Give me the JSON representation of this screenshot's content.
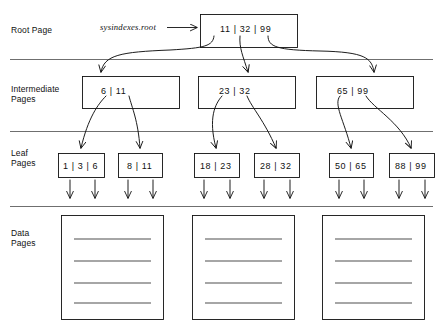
{
  "diagram": {
    "pointer_label": "sysindexes.root",
    "levels": [
      {
        "name": "root",
        "label": "Root Page"
      },
      {
        "name": "intermediate",
        "label": "Intermediate\nPages"
      },
      {
        "name": "leaf",
        "label": "Leaf\nPages"
      },
      {
        "name": "data",
        "label": "Data\nPages"
      }
    ],
    "root_page": {
      "keys": "11 | 32 | 99"
    },
    "intermediate_pages": [
      {
        "keys": "6 | 11"
      },
      {
        "keys": "23 | 32"
      },
      {
        "keys": "65 | 99"
      }
    ],
    "leaf_pages": [
      {
        "keys": "1 | 3 | 6"
      },
      {
        "keys": "8 | 11"
      },
      {
        "keys": "18 | 23"
      },
      {
        "keys": "28 | 32"
      },
      {
        "keys": "50 | 65"
      },
      {
        "keys": "88 | 99"
      }
    ],
    "data_pages": [
      {
        "rows": 4
      },
      {
        "rows": 4
      },
      {
        "rows": 4
      }
    ],
    "colors": {
      "ink": "#111111",
      "divider": "#555555",
      "background": "#ffffff"
    }
  }
}
